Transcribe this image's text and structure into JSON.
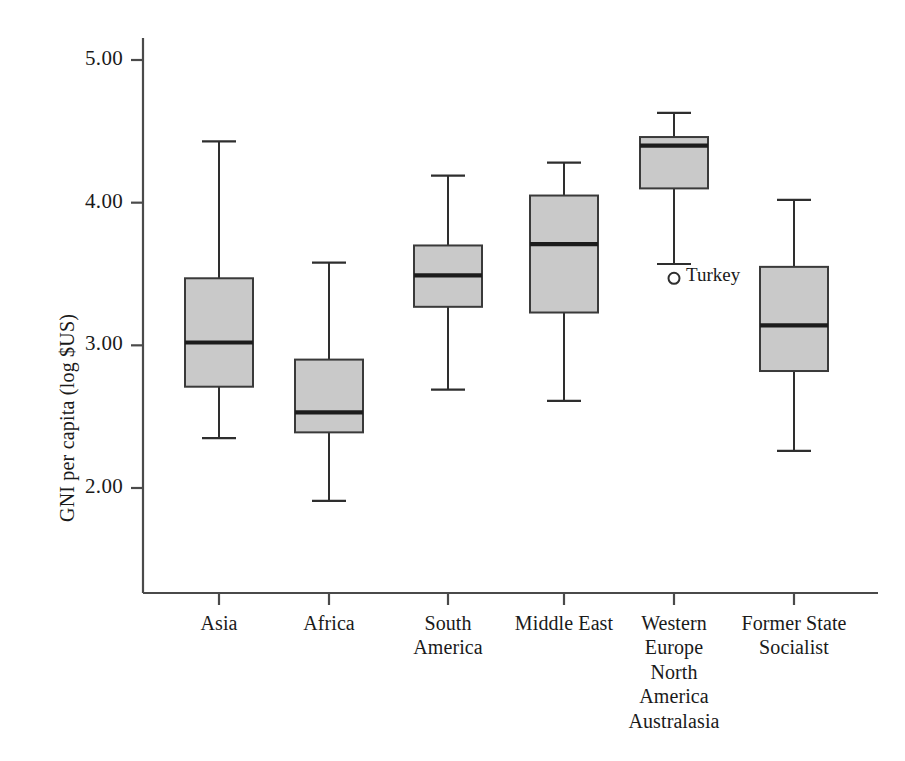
{
  "chart_data": {
    "type": "box",
    "title": "",
    "xlabel": "",
    "ylabel": "GNI per capita (log $US)",
    "ylim": [
      1.5,
      5.15
    ],
    "y_ticks": [
      2.0,
      3.0,
      4.0,
      5.0
    ],
    "y_tick_labels": [
      "2.00",
      "3.00",
      "4.00",
      "5.00"
    ],
    "grid": false,
    "legend": "none",
    "categories": [
      "Asia",
      "Africa",
      "South\nAmerica",
      "Middle East",
      "Western\nEurope\nNorth\nAmerica\nAustralasia",
      "Former State\nSocialist"
    ],
    "boxes": [
      {
        "category": "Asia",
        "label_lines": [
          "Asia"
        ],
        "whisker_low": 2.35,
        "q1": 2.71,
        "median": 3.02,
        "q3": 3.47,
        "whisker_high": 4.43,
        "outliers": []
      },
      {
        "category": "Africa",
        "label_lines": [
          "Africa"
        ],
        "whisker_low": 1.91,
        "q1": 2.39,
        "median": 2.53,
        "q3": 2.9,
        "whisker_high": 3.58,
        "outliers": []
      },
      {
        "category": "South America",
        "label_lines": [
          "South",
          "America"
        ],
        "whisker_low": 2.69,
        "q1": 3.27,
        "median": 3.49,
        "q3": 3.7,
        "whisker_high": 4.19,
        "outliers": []
      },
      {
        "category": "Middle East",
        "label_lines": [
          "Middle East"
        ],
        "whisker_low": 2.61,
        "q1": 3.23,
        "median": 3.71,
        "q3": 4.05,
        "whisker_high": 4.28,
        "outliers": []
      },
      {
        "category": "Western Europe North America Australasia",
        "label_lines": [
          "Western",
          "Europe",
          "North",
          "America",
          "Australasia"
        ],
        "whisker_low": 3.57,
        "q1": 4.1,
        "median": 4.4,
        "q3": 4.46,
        "whisker_high": 4.63,
        "outliers": [
          {
            "label": "Turkey",
            "value": 3.47
          }
        ]
      },
      {
        "category": "Former State Socialist",
        "label_lines": [
          "Former State",
          "Socialist"
        ],
        "whisker_low": 2.26,
        "q1": 2.82,
        "median": 3.14,
        "q3": 3.55,
        "whisker_high": 4.02,
        "outliers": []
      }
    ],
    "colors": {
      "box_fill": "#c9c9c9",
      "box_stroke": "#3a3a3a",
      "median_stroke": "#1c1c1c",
      "whisker_stroke": "#2e2e2e",
      "axis_stroke": "#4a4a4a",
      "text": "#1a1a1a",
      "background": "#ffffff"
    }
  }
}
